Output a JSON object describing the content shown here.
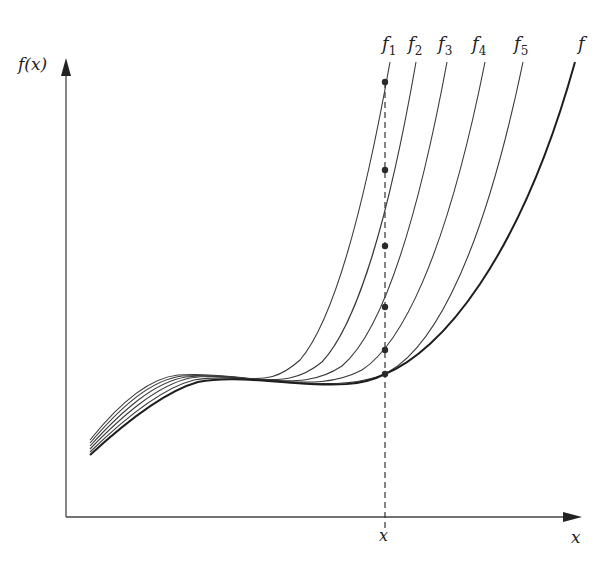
{
  "diagram": {
    "y_axis_label": "f(x)",
    "x_axis_label": "x",
    "x_marker_label": "x",
    "curve_labels": [
      {
        "name": "f",
        "sub": "1"
      },
      {
        "name": "f",
        "sub": "2"
      },
      {
        "name": "f",
        "sub": "3"
      },
      {
        "name": "f",
        "sub": "4"
      },
      {
        "name": "f",
        "sub": "5"
      },
      {
        "name": "f",
        "sub": ""
      }
    ]
  }
}
